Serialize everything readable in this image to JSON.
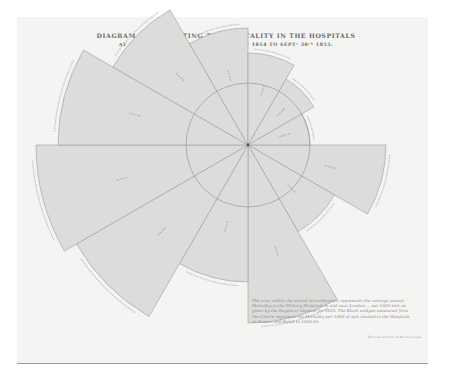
{
  "header": {
    "title": "DIAGRAM REPRESENTING THE MORTALITY IN THE HOSPITALS",
    "subtitle": "AT SCUTARI AND KULALI, FROM OCTʳ 1ˢᵗ 1854 TO SEPTʳ 30ᵗʰ 1855."
  },
  "legend": {
    "text": "The area within the dotted circumference represents the average annual Mortality in the Military Hospitals in and near London ... per 1000 sick as given by the Registrar General for 1853. The Black wedges measured from the Centre represent the Mortality per 1000 of sick treated in the Hospitals at Scutari and Kulali in 1854-55."
  },
  "imprint": "Harrison & Sons, St Martin's Lane",
  "colors": {
    "wedge_fill": "#dcdcda",
    "wedge_stroke": "#9c9c9c",
    "sheet": "#f4f4f3",
    "text": "#7a7a7a"
  },
  "chart_data": {
    "type": "polar-area",
    "center_px": [
      248,
      145
    ],
    "reference_circle_radius_px": 62,
    "angle_start_deg": 0,
    "wedge_span_deg": 30,
    "categories": [
      "Wedge 1",
      "Wedge 2",
      "Wedge 3",
      "Wedge 4",
      "Wedge 5",
      "Wedge 6",
      "Wedge 7",
      "Wedge 8",
      "Wedge 9",
      "Wedge 10",
      "Wedge 11",
      "Wedge 12"
    ],
    "radii_px": [
      138,
      100,
      178,
      137,
      198,
      212,
      190,
      156,
      117,
      92,
      76,
      62
    ],
    "labels_note": "Month names and mortality-per-1000 values printed inside each wedge are illegible at this resolution",
    "legend_position": "bottom-right"
  }
}
